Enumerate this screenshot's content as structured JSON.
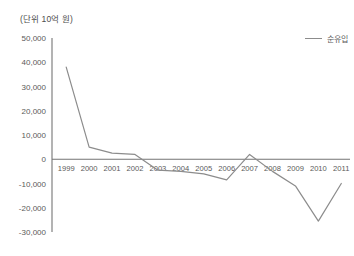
{
  "unit_note": "(단위 10억 원)",
  "legend": {
    "series_label": "순유입",
    "swatch_name": "line-swatch"
  },
  "axis": {
    "y_ticks": [
      "50,000",
      "40,000",
      "30,000",
      "20,000",
      "10,000",
      "0",
      "-10,000",
      "-20,000",
      "-30,000"
    ],
    "x_ticks": [
      "1999",
      "2000",
      "2001",
      "2002",
      "2003",
      "2004",
      "2005",
      "2006",
      "2007",
      "2008",
      "2009",
      "2010",
      "2011"
    ]
  },
  "colors": {
    "line": "#8c8c8c",
    "axis": "#808080",
    "baseline": "#737373",
    "text": "#5a5a5a",
    "background": "#ffffff"
  },
  "chart_data": {
    "type": "line",
    "title": "",
    "subtitle": "",
    "xlabel": "",
    "ylabel": "(단위 10억 원)",
    "x": [
      1999,
      2000,
      2001,
      2002,
      2003,
      2004,
      2005,
      2006,
      2007,
      2008,
      2009,
      2010,
      2011
    ],
    "categories": [
      "1999",
      "2000",
      "2001",
      "2002",
      "2003",
      "2004",
      "2005",
      "2006",
      "2007",
      "2008",
      "2009",
      "2010",
      "2011"
    ],
    "series": [
      {
        "name": "순유입",
        "values": [
          38000,
          5000,
          2500,
          2000,
          -4500,
          -5000,
          -6000,
          -8500,
          2000,
          -5000,
          -11000,
          -25500,
          -10000
        ]
      }
    ],
    "ylim": [
      -30000,
      50000
    ],
    "ytick_values": [
      50000,
      40000,
      30000,
      20000,
      10000,
      0,
      -10000,
      -20000,
      -30000
    ],
    "xlim": [
      1999,
      2011
    ],
    "grid": false,
    "legend_position": "top-right",
    "zero_line": true,
    "annotations": []
  }
}
